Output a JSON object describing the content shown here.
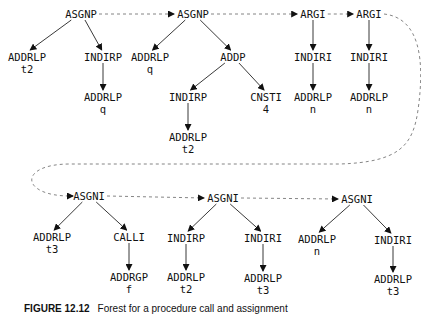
{
  "diagram": {
    "type": "forest-of-trees",
    "nodes": [
      {
        "id": "n1",
        "label": "ASGNP",
        "sub": "",
        "x": 81,
        "y": 14
      },
      {
        "id": "n2",
        "label": "ADDRLP",
        "sub": "t2",
        "x": 27,
        "y": 63
      },
      {
        "id": "n3",
        "label": "INDIRP",
        "sub": "",
        "x": 103,
        "y": 57
      },
      {
        "id": "n4",
        "label": "ADDRLP",
        "sub": "q",
        "x": 103,
        "y": 103
      },
      {
        "id": "n5",
        "label": "ASGNP",
        "sub": "",
        "x": 193,
        "y": 14
      },
      {
        "id": "n6",
        "label": "ADDRLP",
        "sub": "q",
        "x": 150,
        "y": 63
      },
      {
        "id": "n7",
        "label": "ADDP",
        "sub": "",
        "x": 233,
        "y": 57
      },
      {
        "id": "n8",
        "label": "INDIRP",
        "sub": "",
        "x": 188,
        "y": 97
      },
      {
        "id": "n9",
        "label": "CNSTI",
        "sub": "4",
        "x": 266,
        "y": 103
      },
      {
        "id": "n10",
        "label": "ADDRLP",
        "sub": "t2",
        "x": 188,
        "y": 143
      },
      {
        "id": "n11",
        "label": "ARGI",
        "sub": "",
        "x": 313,
        "y": 14
      },
      {
        "id": "n12",
        "label": "INDIRI",
        "sub": "",
        "x": 313,
        "y": 57
      },
      {
        "id": "n13",
        "label": "ADDRLP",
        "sub": "n",
        "x": 313,
        "y": 103
      },
      {
        "id": "n14",
        "label": "ARGI",
        "sub": "",
        "x": 369,
        "y": 14
      },
      {
        "id": "n15",
        "label": "INDIRI",
        "sub": "",
        "x": 369,
        "y": 57
      },
      {
        "id": "n16",
        "label": "ADDRLP",
        "sub": "n",
        "x": 369,
        "y": 103
      },
      {
        "id": "n17",
        "label": "ASGNI",
        "sub": "",
        "x": 89,
        "y": 196
      },
      {
        "id": "n18",
        "label": "ADDRLP",
        "sub": "t3",
        "x": 52,
        "y": 243
      },
      {
        "id": "n19",
        "label": "CALLI",
        "sub": "",
        "x": 129,
        "y": 237
      },
      {
        "id": "n20",
        "label": "ADDRGP",
        "sub": "f",
        "x": 129,
        "y": 283
      },
      {
        "id": "n21",
        "label": "ASGNI",
        "sub": "",
        "x": 223,
        "y": 198
      },
      {
        "id": "n22",
        "label": "INDIRP",
        "sub": "",
        "x": 186,
        "y": 238
      },
      {
        "id": "n23",
        "label": "ADDRLP",
        "sub": "t2",
        "x": 186,
        "y": 283
      },
      {
        "id": "n24",
        "label": "INDIRI",
        "sub": "",
        "x": 263,
        "y": 238
      },
      {
        "id": "n25",
        "label": "ADDRLP",
        "sub": "t3",
        "x": 263,
        "y": 284
      },
      {
        "id": "n26",
        "label": "ASGNI",
        "sub": "",
        "x": 357,
        "y": 199
      },
      {
        "id": "n27",
        "label": "ADDRLP",
        "sub": "n",
        "x": 317,
        "y": 245
      },
      {
        "id": "n28",
        "label": "INDIRI",
        "sub": "",
        "x": 393,
        "y": 240
      },
      {
        "id": "n29",
        "label": "ADDRLP",
        "sub": "t3",
        "x": 393,
        "y": 285
      }
    ],
    "edges": [
      [
        "n1",
        "n2"
      ],
      [
        "n1",
        "n3"
      ],
      [
        "n3",
        "n4"
      ],
      [
        "n5",
        "n6"
      ],
      [
        "n5",
        "n7"
      ],
      [
        "n7",
        "n8"
      ],
      [
        "n7",
        "n9"
      ],
      [
        "n8",
        "n10"
      ],
      [
        "n11",
        "n12"
      ],
      [
        "n12",
        "n13"
      ],
      [
        "n14",
        "n15"
      ],
      [
        "n15",
        "n16"
      ],
      [
        "n17",
        "n18"
      ],
      [
        "n17",
        "n19"
      ],
      [
        "n19",
        "n20"
      ],
      [
        "n21",
        "n22"
      ],
      [
        "n21",
        "n24"
      ],
      [
        "n22",
        "n23"
      ],
      [
        "n24",
        "n25"
      ],
      [
        "n26",
        "n27"
      ],
      [
        "n26",
        "n28"
      ],
      [
        "n28",
        "n29"
      ]
    ],
    "sequence_links": [
      [
        "n1",
        "n5"
      ],
      [
        "n5",
        "n11"
      ],
      [
        "n11",
        "n14"
      ],
      [
        "n14",
        "n17"
      ],
      [
        "n17",
        "n21"
      ],
      [
        "n21",
        "n26"
      ]
    ]
  },
  "caption": {
    "label": "FIGURE 12.12",
    "text": "Forest for a procedure call and assignment"
  }
}
